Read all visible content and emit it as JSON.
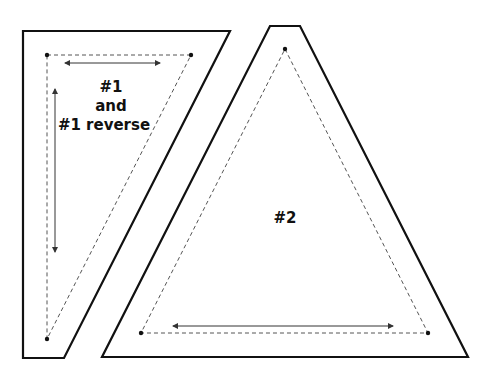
{
  "diagram": {
    "colors": {
      "outline": "#111111",
      "seam": "#555555",
      "arrow": "#333333",
      "background": "#ffffff"
    },
    "pieces": [
      {
        "id": "piece-1",
        "label_lines": [
          "#1",
          "and",
          "#1 reverse"
        ],
        "outer": "23,31 230,31 64,358 23,358",
        "seam": "47,55 191,55 47,339",
        "dots": [
          [
            47,
            55
          ],
          [
            191,
            55
          ],
          [
            47,
            339
          ]
        ],
        "grain_arrows": [
          {
            "x1": 65,
            "y1": 63,
            "x2": 160,
            "y2": 63
          },
          {
            "x1": 55,
            "y1": 89,
            "x2": 55,
            "y2": 252
          }
        ]
      },
      {
        "id": "piece-2",
        "label_lines": [
          "#2"
        ],
        "outer": "270,26 300,26 468,357 102,357",
        "seam": "285,49 428,333 141,333",
        "dots": [
          [
            285,
            49
          ],
          [
            428,
            333
          ],
          [
            141,
            333
          ]
        ],
        "grain_arrows": [
          {
            "x1": 173,
            "y1": 326,
            "x2": 393,
            "y2": 326
          }
        ]
      }
    ]
  }
}
